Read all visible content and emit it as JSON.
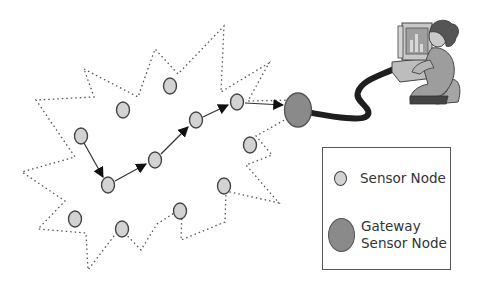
{
  "diagram": {
    "colors": {
      "sensor_fill": "#d3d3d3",
      "sensor_stroke": "#444444",
      "gateway_fill": "#8a8a8a",
      "boundary": "#555555",
      "cable": "#222222"
    },
    "sensor_nodes": [
      {
        "id": "n1",
        "x": 81,
        "y": 136
      },
      {
        "id": "n2",
        "x": 108,
        "y": 185
      },
      {
        "id": "n3",
        "x": 155,
        "y": 160
      },
      {
        "id": "n4",
        "x": 196,
        "y": 120
      },
      {
        "id": "n5",
        "x": 237,
        "y": 102
      },
      {
        "id": "n6",
        "x": 123,
        "y": 110
      },
      {
        "id": "n7",
        "x": 170,
        "y": 86
      },
      {
        "id": "n8",
        "x": 250,
        "y": 145
      },
      {
        "id": "n9",
        "x": 224,
        "y": 186
      },
      {
        "id": "n10",
        "x": 180,
        "y": 211
      },
      {
        "id": "n11",
        "x": 122,
        "y": 229
      },
      {
        "id": "n12",
        "x": 75,
        "y": 219
      }
    ],
    "gateway": {
      "x": 298,
      "y": 110
    },
    "route": [
      "n1",
      "n2",
      "n3",
      "n4",
      "n5",
      "gateway"
    ],
    "workstation": "user-at-computer-illustration"
  },
  "legend": {
    "items": [
      {
        "label_lines": [
          "Sensor Node"
        ],
        "symbol": "sensor-node"
      },
      {
        "label_lines": [
          "Gateway",
          "Sensor Node"
        ],
        "symbol": "gateway-node"
      }
    ]
  }
}
